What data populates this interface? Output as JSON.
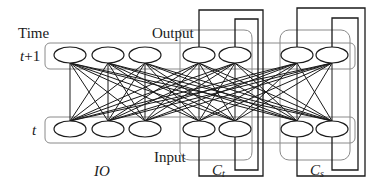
{
  "labels": {
    "time": "Time",
    "t_plus_1": "t+1",
    "t_plus_1_var": "t",
    "t_plus_1_suffix": "+1",
    "t": "t",
    "output": "Output",
    "input": "Input",
    "io": "IO",
    "ct": "C",
    "ct_sub": "t",
    "cs": "C",
    "cs_sub": "s"
  },
  "colors": {
    "line": "#1a1a1a",
    "box": "#888888"
  },
  "nodes": {
    "top_y": 55,
    "bottom_y": 129,
    "x": [
      70,
      108,
      145,
      199,
      235,
      297,
      332
    ],
    "groups": [
      "IO",
      "IO",
      "IO",
      "Ct",
      "Ct",
      "Cs",
      "Cs"
    ]
  }
}
